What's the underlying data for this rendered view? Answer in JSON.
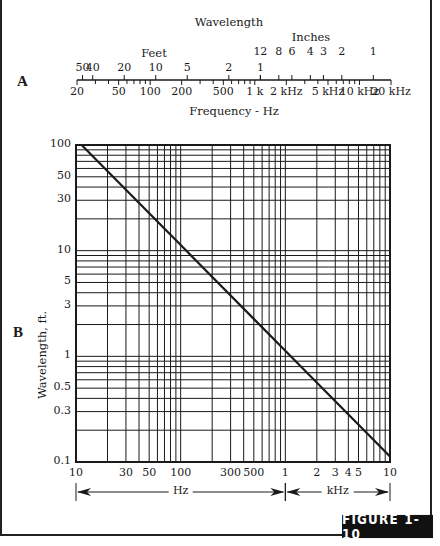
{
  "figure": {
    "label": "FIGURE 1-10",
    "panel_a_label": "A",
    "panel_b_label": "B"
  },
  "colors": {
    "ink": "#1a1a1a",
    "background": "#ffffff",
    "label_bg": "#111111",
    "label_fg": "#ffffff"
  },
  "chart_data": [
    {
      "type": "nomogram",
      "panel": "A",
      "title": "Wavelength",
      "xlabel": "Frequency - Hz",
      "scale": "log",
      "frequency_range_hz": [
        20,
        20000
      ],
      "frequency_ticks": [
        {
          "value": 20,
          "label": "20"
        },
        {
          "value": 50,
          "label": "50"
        },
        {
          "value": 100,
          "label": "100"
        },
        {
          "value": 200,
          "label": "200"
        },
        {
          "value": 500,
          "label": "500"
        },
        {
          "value": 1000,
          "label": "1 k"
        },
        {
          "value": 2000,
          "label": "2 kHz"
        },
        {
          "value": 5000,
          "label": "5 kHz"
        },
        {
          "value": 10000,
          "label": "10 kHz"
        },
        {
          "value": 20000,
          "label": "20 kHz"
        }
      ],
      "frequency_minor_ticks": [
        30,
        40,
        60,
        70,
        80,
        90,
        300,
        400,
        600,
        700,
        800,
        900,
        3000,
        4000,
        6000,
        7000,
        8000,
        9000
      ],
      "wavelength_feet_label": "Feet",
      "wavelength_feet_ticks": [
        {
          "value": 50,
          "label": "50"
        },
        {
          "value": 40,
          "label": "40"
        },
        {
          "value": 20,
          "label": "20"
        },
        {
          "value": 10,
          "label": "10"
        },
        {
          "value": 5,
          "label": "5"
        },
        {
          "value": 2,
          "label": "2"
        },
        {
          "value": 1,
          "label": "1"
        }
      ],
      "wavelength_inches_label": "Inches",
      "wavelength_inches_ticks": [
        {
          "value": 12,
          "label": "12"
        },
        {
          "value": 8,
          "label": "8"
        },
        {
          "value": 6,
          "label": "6"
        },
        {
          "value": 4,
          "label": "4"
        },
        {
          "value": 3,
          "label": "3"
        },
        {
          "value": 2,
          "label": "2"
        },
        {
          "value": 1,
          "label": "1"
        }
      ],
      "speed_of_sound_ft_per_s": 1130
    },
    {
      "type": "line",
      "panel": "B",
      "title": "",
      "xlabel": "Frequency",
      "ylabel": "Wavelength, ft.",
      "xscale": "log",
      "yscale": "log",
      "xlim": [
        10,
        10000
      ],
      "ylim": [
        0.1,
        100
      ],
      "grid": true,
      "x_ticks": [
        {
          "value": 10,
          "label": "10"
        },
        {
          "value": 30,
          "label": "30"
        },
        {
          "value": 50,
          "label": "50"
        },
        {
          "value": 100,
          "label": "100"
        },
        {
          "value": 300,
          "label": "300"
        },
        {
          "value": 500,
          "label": "500"
        },
        {
          "value": 1000,
          "label": "1"
        },
        {
          "value": 2000,
          "label": "2"
        },
        {
          "value": 3000,
          "label": "3"
        },
        {
          "value": 4000,
          "label": "4"
        },
        {
          "value": 5000,
          "label": "5"
        },
        {
          "value": 10000,
          "label": "10"
        }
      ],
      "y_ticks": [
        {
          "value": 100,
          "label": "100"
        },
        {
          "value": 50,
          "label": "50"
        },
        {
          "value": 30,
          "label": "30"
        },
        {
          "value": 10,
          "label": "10"
        },
        {
          "value": 5,
          "label": "5"
        },
        {
          "value": 3,
          "label": "3"
        },
        {
          "value": 1,
          "label": "1"
        },
        {
          "value": 0.5,
          "label": "0.5"
        },
        {
          "value": 0.3,
          "label": "0.3"
        },
        {
          "value": 0.1,
          "label": "0.1"
        }
      ],
      "x_unit_ranges": [
        {
          "label": "Hz",
          "from": 10,
          "to": 1000
        },
        {
          "label": "kHz",
          "from": 1000,
          "to": 10000
        }
      ],
      "series": [
        {
          "name": "Wavelength",
          "x": [
            11.3,
            100,
            1000,
            10000
          ],
          "y": [
            100,
            11.3,
            1.13,
            0.113
          ]
        }
      ]
    }
  ]
}
